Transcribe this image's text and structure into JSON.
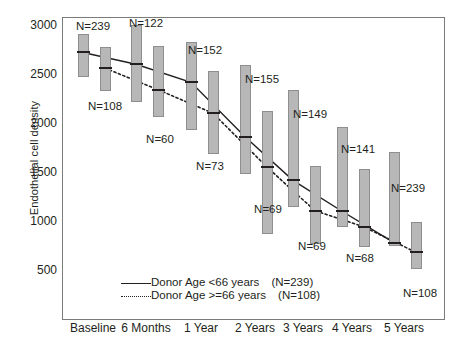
{
  "chart_data": {
    "type": "line",
    "title": "",
    "xlabel": "",
    "ylabel": "Endothelial cell density",
    "categories": [
      "Baseline",
      "6 Months",
      "1 Year",
      "2 Years",
      "3 Years",
      "4 Years",
      "5 Years"
    ],
    "ylim": [
      0,
      3150
    ],
    "yticks": [
      500,
      1000,
      1500,
      2000,
      2500,
      3000
    ],
    "grid": false,
    "legend_position": "lower-left-inside",
    "series": [
      {
        "name": "Donor Age <66 years",
        "legend_n": "(N=239)",
        "style": "solid",
        "values": [
          2730,
          2610,
          2425,
          1870,
          1425,
          1110,
          790
        ],
        "n_labels": [
          "N=239",
          "N=122",
          "N=152",
          "N=155",
          "N=149",
          "N=141",
          "N=239"
        ],
        "box_high": [
          2920,
          3010,
          2840,
          2600,
          2350,
          1970,
          1715
        ],
        "box_low": [
          2480,
          2220,
          1940,
          1490,
          1150,
          945,
          760
        ]
      },
      {
        "name": "Donor Age >=66 years",
        "legend_n": "(N=108)",
        "style": "dotted",
        "values": [
          2570,
          2350,
          2110,
          1560,
          1115,
          950,
          690
        ],
        "n_labels": [
          "N=108",
          "N=60",
          "N=73",
          "N=69",
          "N=69",
          "N=68",
          "N=108"
        ],
        "box_high": [
          2790,
          2800,
          2545,
          2130,
          1570,
          1540,
          1005
        ],
        "box_low": [
          2340,
          2070,
          1690,
          880,
          780,
          745,
          520
        ]
      }
    ],
    "annotations": {
      "n_label_text_above": [
        "N=239",
        "N=122",
        "N=152",
        "N=155",
        "N=149",
        "N=141",
        "N=239"
      ],
      "n_label_text_below": [
        "N=108",
        "N=60",
        "N=73",
        "N=69",
        "N=69",
        "N=68",
        "N=108"
      ]
    },
    "colors": {
      "bar_fill": "#b7b7b7",
      "bar_edge": "#8e8e8e",
      "line": "#231f20",
      "frame": "#7b7b7b",
      "background": "#ffffff"
    }
  },
  "legend": {
    "solid_label": "Donor Age <66 years",
    "solid_n": "(N=239)",
    "dotted_label": "Donor Age >=66 years",
    "dotted_n": "(N=108)"
  }
}
